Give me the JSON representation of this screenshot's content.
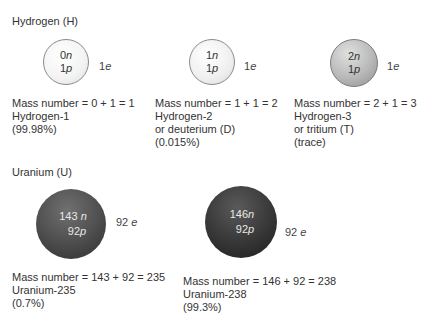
{
  "hydrogen": {
    "heading": "Hydrogen (H)",
    "isotopes": [
      {
        "neutrons": "0",
        "protons": "1",
        "n_sym": "n",
        "p_sym": "p",
        "electrons": "1",
        "e_sym": "e",
        "mass_eq": "Mass number = 0 + 1 = 1",
        "name": "Hydrogen-1",
        "alt_name": "",
        "abundance": "(99.98%)",
        "color": "#f3f3f3"
      },
      {
        "neutrons": "1",
        "protons": "1",
        "n_sym": "n",
        "p_sym": "p",
        "electrons": "1",
        "e_sym": "e",
        "mass_eq": "Mass number = 1 + 1 = 2",
        "name": "Hydrogen-2",
        "alt_name": "or deuterium (D)",
        "abundance": "(0.015%)",
        "color": "#efefef"
      },
      {
        "neutrons": "2",
        "protons": "1",
        "n_sym": "n",
        "p_sym": "p",
        "electrons": "1",
        "e_sym": "e",
        "mass_eq": "Mass number = 2 + 1 = 3",
        "name": "Hydrogen-3",
        "alt_name": "or tritium (T)",
        "abundance": "(trace)",
        "color": "#b9b9b9"
      }
    ]
  },
  "uranium": {
    "heading": "Uranium (U)",
    "isotopes": [
      {
        "neutrons": "143 ",
        "protons": "92",
        "n_sym": "n",
        "p_sym": "p",
        "electrons": "92 ",
        "e_sym": "e",
        "mass_eq": "Mass number = 143 + 92 = 235",
        "name": "Uranium-235",
        "abundance": "(0.7%)",
        "color": "#505050"
      },
      {
        "neutrons": "146",
        "protons": "92",
        "n_sym": "n",
        "p_sym": "p",
        "electrons": "92 ",
        "e_sym": "e",
        "mass_eq": "Mass number = 146 + 92 = 238",
        "name": "Uranium-238",
        "abundance": "(99.3%)",
        "color": "#3a3a3a"
      }
    ]
  }
}
